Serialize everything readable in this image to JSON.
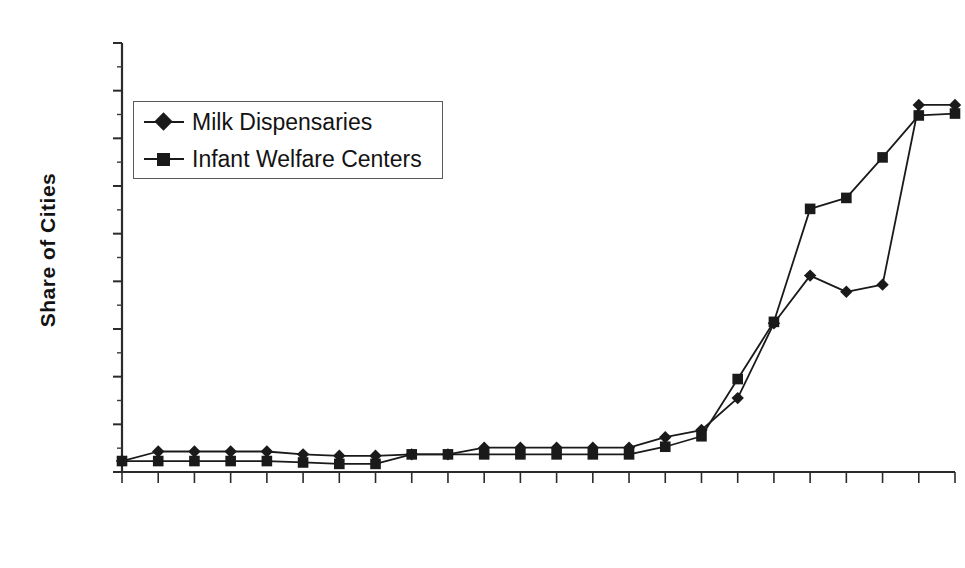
{
  "chart_data": {
    "type": "line",
    "title": "",
    "xlabel": "",
    "ylabel": "Share of Cities",
    "xlim": [
      1888,
      1911
    ],
    "ylim": [
      0,
      90
    ],
    "ytick_step": 10,
    "xtick_step": 4,
    "xtick_minor_step": 1,
    "grid": false,
    "legend_position": "upper-left-inside",
    "yticks": [
      0,
      10,
      20,
      30,
      40,
      50,
      60,
      70,
      80,
      90
    ],
    "ytick_labels": [
      "0",
      "10",
      "20",
      "30",
      "40",
      "50",
      "60",
      "70",
      "80",
      "90"
    ],
    "xticks": [
      1888,
      1892,
      1896,
      1900,
      1904,
      1908
    ],
    "xtick_labels": [
      "1888",
      "1892",
      "1896",
      "1900",
      "1904",
      "1908"
    ],
    "x": [
      1888,
      1889,
      1890,
      1891,
      1892,
      1893,
      1894,
      1895,
      1896,
      1897,
      1898,
      1899,
      1900,
      1901,
      1902,
      1903,
      1904,
      1905,
      1906,
      1907,
      1908,
      1909,
      1910,
      1911
    ],
    "series": [
      {
        "name": "Milk Dispensaries",
        "marker": "diamond",
        "color": "#1a1a1a",
        "values": [
          2.3,
          4.3,
          4.3,
          4.3,
          4.3,
          3.7,
          3.4,
          3.4,
          3.7,
          3.7,
          5.1,
          5.1,
          5.1,
          5.1,
          5.1,
          7.3,
          8.8,
          15.5,
          31.2,
          41.2,
          37.8,
          39.3,
          77.0,
          77.0
        ]
      },
      {
        "name": "Infant Welfare Centers",
        "marker": "square",
        "color": "#1a1a1a",
        "values": [
          2.3,
          2.3,
          2.3,
          2.3,
          2.3,
          2.0,
          1.7,
          1.7,
          3.7,
          3.7,
          3.7,
          3.7,
          3.7,
          3.7,
          3.7,
          5.3,
          7.5,
          19.5,
          31.5,
          55.2,
          57.5,
          66.0,
          74.8,
          75.2
        ]
      }
    ]
  },
  "axis": {
    "y_title": "Share of Cities"
  },
  "legend": {
    "entries": [
      {
        "label": "Milk Dispensaries",
        "marker": "diamond-marker-icon"
      },
      {
        "label": "Infant Welfare Centers",
        "marker": "square-marker-icon"
      }
    ]
  },
  "geometry": {
    "plot_left": 122,
    "plot_right": 955,
    "plot_top": 43,
    "plot_bottom": 472
  }
}
